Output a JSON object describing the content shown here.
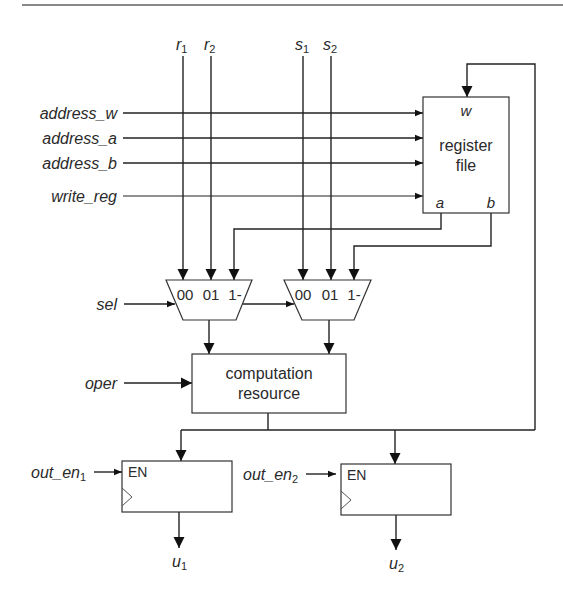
{
  "diagram": {
    "inputs_top": {
      "r1": {
        "base": "r",
        "sub": "1"
      },
      "r2": {
        "base": "r",
        "sub": "2"
      },
      "s1": {
        "base": "s",
        "sub": "1"
      },
      "s2": {
        "base": "s",
        "sub": "2"
      }
    },
    "inputs_left": {
      "address_w": "address_w",
      "address_a": "address_a",
      "address_b": "address_b",
      "write_reg": "write_reg",
      "sel": "sel",
      "oper": "oper",
      "out_en1": {
        "base": "out_en",
        "sub": "1"
      },
      "out_en2": {
        "base": "out_en",
        "sub": "2"
      }
    },
    "register_file": {
      "line1": "register",
      "line2": "file",
      "port_w": "w",
      "port_a": "a",
      "port_b": "b"
    },
    "mux1": {
      "in0": "00",
      "in1": "01",
      "in2": "1-"
    },
    "mux2": {
      "in0": "00",
      "in1": "01",
      "in2": "1-"
    },
    "computation": {
      "line1": "computation",
      "line2": "resource"
    },
    "reg_out1": {
      "en": "EN"
    },
    "reg_out2": {
      "en": "EN"
    },
    "outputs": {
      "u1": {
        "base": "u",
        "sub": "1"
      },
      "u2": {
        "base": "u",
        "sub": "2"
      }
    }
  }
}
